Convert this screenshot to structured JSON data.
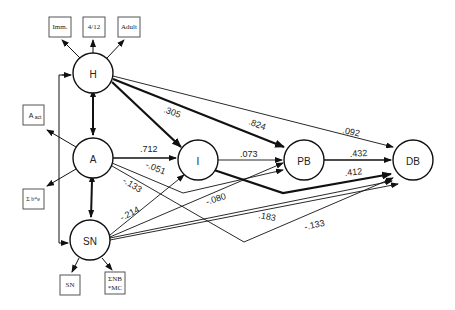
{
  "diagram": {
    "type": "path-model",
    "nodes": {
      "H": {
        "label": "H",
        "cx": 93,
        "cy": 73
      },
      "A": {
        "label": "A",
        "cx": 93,
        "cy": 158
      },
      "SN": {
        "label": "SN",
        "cx": 90,
        "cy": 240
      },
      "I": {
        "label": "I",
        "cx": 198,
        "cy": 160
      },
      "PB": {
        "label": "PB",
        "cx": 304,
        "cy": 160
      },
      "DB": {
        "label": "DB",
        "cx": 413,
        "cy": 160
      }
    },
    "indicators": {
      "h_imm": {
        "label": "Imm."
      },
      "h_412": {
        "label": "4/12"
      },
      "h_adult": {
        "label": "Adult"
      },
      "a_act": {
        "label": "A",
        "sub": "act"
      },
      "a_sum": {
        "label": "Σ b*e"
      },
      "sn_sn": {
        "label": "SN"
      },
      "sn_nb_line1": {
        "label": "ΣNB"
      },
      "sn_nb_line2": {
        "label": "*MC"
      }
    },
    "paths": {
      "A_I": ".712",
      "A_PB": "-.051",
      "A_DB": "-.133",
      "H_I": ".305",
      "H_PB": ".824",
      "H_DB": ".092",
      "I_PB": ".073",
      "I_DB": ".412",
      "PB_DB": ".432",
      "SN_I": "-.214",
      "SN_PB": "-.080",
      "SN_DB1": ".183",
      "SN_DB2": "-.133"
    }
  }
}
